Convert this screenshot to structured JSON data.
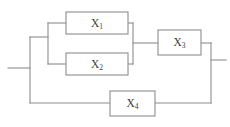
{
  "diagram": {
    "type": "reliability-block-diagram",
    "colors": {
      "line": "#8d8d8d",
      "background": "#ffffff",
      "label": "#3b3b3b"
    },
    "blocks": [
      {
        "id": "x1",
        "label": "X",
        "subscript": "1",
        "full_label": "X1",
        "x": 66,
        "y": 12,
        "width": 62,
        "height": 22
      },
      {
        "id": "x2",
        "label": "X",
        "subscript": "2",
        "full_label": "X2",
        "x": 66,
        "y": 53,
        "width": 62,
        "height": 22
      },
      {
        "id": "x3",
        "label": "X",
        "subscript": "3",
        "full_label": "X3",
        "x": 158,
        "y": 30,
        "width": 43,
        "height": 25
      },
      {
        "id": "x4",
        "label": "X",
        "subscript": "4",
        "full_label": "X4",
        "x": 110,
        "y": 91,
        "width": 45,
        "height": 25
      }
    ],
    "terminals": {
      "input_label": "",
      "output_label": ""
    }
  }
}
